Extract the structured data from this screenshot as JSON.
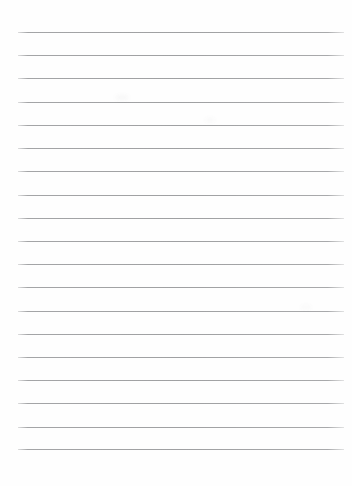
{
  "page": {
    "kind": "lined-paper-scan",
    "width": 352,
    "height": 486,
    "background_color": "#fefefe",
    "text_content": "",
    "note": "blank ruled notebook page, no written content"
  },
  "ruling": {
    "line_count": 19,
    "line_color": "#9fa0a2",
    "line_thickness_px": 1,
    "first_line_y": 32,
    "last_line_y": 449,
    "line_spacing_px": 23.2,
    "left_margin_px": 18,
    "right_edge_px": 344,
    "line_width_px": 326,
    "lines_y": [
      32,
      55.2,
      78.4,
      101.6,
      124.8,
      148.1,
      171.3,
      194.5,
      217.7,
      240.9,
      264.1,
      287.3,
      310.6,
      333.8,
      357.0,
      380.2,
      403.4,
      426.6,
      449
    ],
    "bottom_blank_space_px": 37
  },
  "artifacts": {
    "smudges": [
      {
        "x": 115,
        "y": 95,
        "w": 14,
        "h": 5,
        "opacity": 0.05
      },
      {
        "x": 205,
        "y": 118,
        "w": 10,
        "h": 4,
        "opacity": 0.045
      },
      {
        "x": 300,
        "y": 305,
        "w": 12,
        "h": 4,
        "opacity": 0.035
      }
    ]
  }
}
